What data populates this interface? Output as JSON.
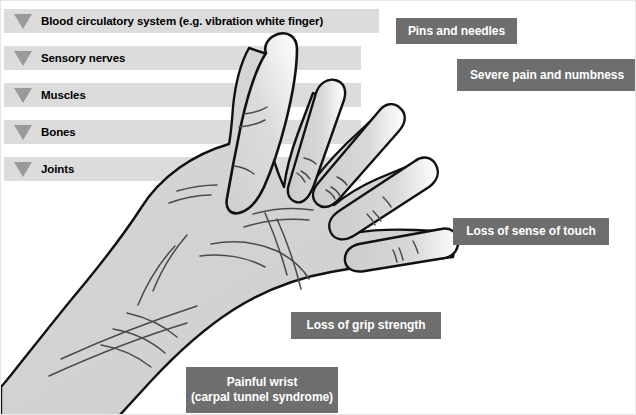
{
  "diagram": {
    "illustration_name": "open-palm-hand-left-hand",
    "colors": {
      "background": "#ffffff",
      "category_bar": "#dcdcdc",
      "category_triangle": "#9a9a9a",
      "callout_background": "#6e6e6e",
      "callout_text": "#ffffff",
      "hand_fill": "#d2d2d2",
      "hand_outline": "#000000",
      "crease_line": "#3c3c3c"
    }
  },
  "categories": [
    {
      "label": "Blood circulatory system (e.g. vibration white finger)",
      "icon": "triangle-down-icon",
      "bar_width": 375,
      "top": 8
    },
    {
      "label": "Sensory nerves",
      "icon": "triangle-down-icon",
      "bar_width": 357,
      "top": 45
    },
    {
      "label": "Muscles",
      "icon": "triangle-down-icon",
      "bar_width": 357,
      "top": 82
    },
    {
      "label": "Bones",
      "icon": "triangle-down-icon",
      "bar_width": 357,
      "top": 119
    },
    {
      "label": "Joints",
      "icon": "triangle-down-icon",
      "bar_width": 357,
      "top": 156
    }
  ],
  "callouts": [
    {
      "name": "pins-and-needles",
      "lines": [
        "Pins and needles"
      ],
      "left": 395,
      "top": 17,
      "width": 121,
      "height": 26
    },
    {
      "name": "severe-pain-and-numbness",
      "lines": [
        "Severe pain and numbness"
      ],
      "left": 456,
      "top": 58,
      "width": 180,
      "height": 32
    },
    {
      "name": "loss-of-sense-of-touch",
      "lines": [
        "Loss of sense of touch"
      ],
      "left": 452,
      "top": 217,
      "width": 156,
      "height": 27
    },
    {
      "name": "loss-of-grip-strength",
      "lines": [
        "Loss of grip strength"
      ],
      "left": 290,
      "top": 311,
      "width": 150,
      "height": 27
    },
    {
      "name": "painful-wrist",
      "lines": [
        "Painful wrist",
        "(carpal tunnel syndrome)"
      ],
      "left": 185,
      "top": 366,
      "width": 152,
      "height": 46
    }
  ]
}
